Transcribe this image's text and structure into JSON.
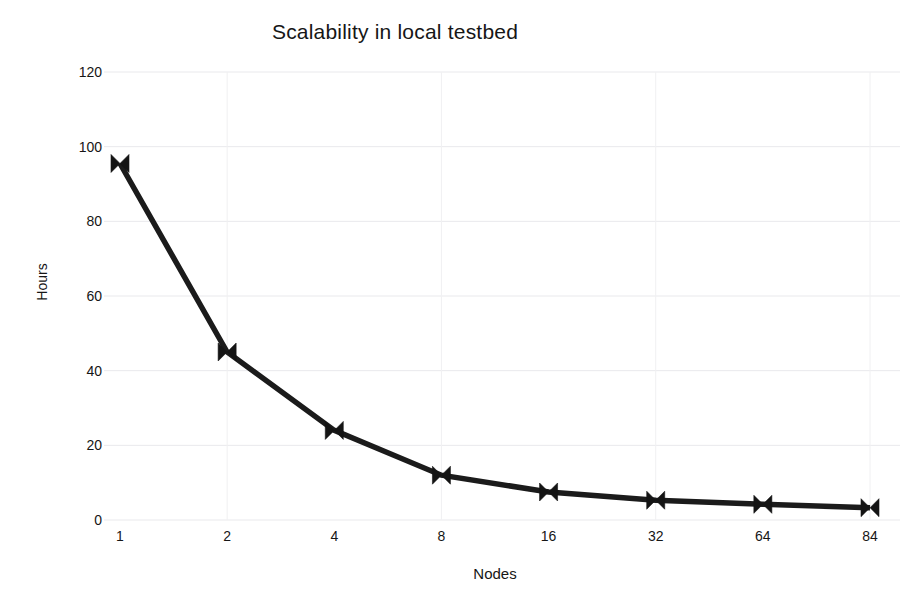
{
  "chart_data": {
    "type": "line",
    "title": "Scalability in local testbed",
    "xlabel": "Nodes",
    "ylabel": "Hours",
    "categories": [
      "1",
      "2",
      "4",
      "8",
      "16",
      "32",
      "64",
      "84"
    ],
    "values": [
      95.5,
      45,
      24,
      12,
      7.5,
      5.3,
      4.2,
      3.3
    ],
    "series": [
      {
        "name": "Hours",
        "values": [
          95.5,
          45,
          24,
          12,
          7.5,
          5.3,
          4.2,
          3.3
        ]
      }
    ],
    "ytick_labels": [
      "0",
      "20",
      "40",
      "60",
      "80",
      "100",
      "120"
    ],
    "ytick_values": [
      0,
      20,
      40,
      60,
      80,
      100,
      120
    ],
    "ylim": [
      0,
      120
    ],
    "grid": true,
    "legend": "none",
    "marker": "bowtie",
    "line_color": "#1b1b1b",
    "grid_color": "#e9e9ec",
    "background_color": "#ffffff",
    "text_color": "#161616"
  }
}
